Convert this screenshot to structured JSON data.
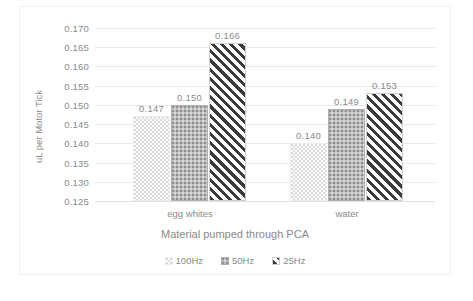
{
  "chart_data": {
    "type": "bar",
    "title": "",
    "xlabel": "Material pumped through PCA",
    "ylabel": "uL per Motor Tick",
    "categories": [
      "egg whites",
      "water"
    ],
    "series": [
      {
        "name": "100Hz",
        "values": [
          0.147,
          0.14
        ],
        "pattern": "light-wave-dots"
      },
      {
        "name": "50Hz",
        "values": [
          0.15,
          0.149
        ],
        "pattern": "grey-dense-dots"
      },
      {
        "name": "25Hz",
        "values": [
          0.166,
          0.153
        ],
        "pattern": "diagonal-stripes"
      }
    ],
    "data_labels": {
      "egg whites": [
        "0.147",
        "0.150",
        "0.166"
      ],
      "water": [
        "0.140",
        "0.149",
        "0.153"
      ]
    },
    "ylim": [
      0.125,
      0.17
    ],
    "ytick_labels": [
      "0.170",
      "0.165",
      "0.160",
      "0.155",
      "0.150",
      "0.145",
      "0.140",
      "0.135",
      "0.130",
      "0.125"
    ],
    "ytick_values": [
      0.17,
      0.165,
      0.16,
      0.155,
      0.15,
      0.145,
      0.14,
      0.135,
      0.13,
      0.125
    ],
    "grid": true,
    "legend_position": "bottom",
    "colors": {
      "text": "#8a8a8a",
      "gridline": "#e8e8e8",
      "series_100hz": "#fdfdfd",
      "series_50hz": "#bdbdbd",
      "series_25hz": "#3a3a3a",
      "background": "#ffffff",
      "border": "#f0f0f0"
    }
  }
}
